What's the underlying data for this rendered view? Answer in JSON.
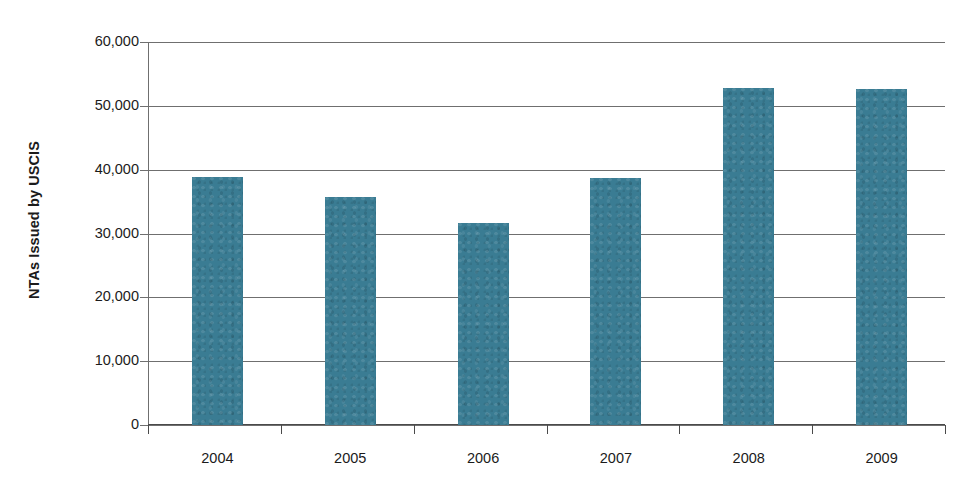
{
  "chart_data": {
    "type": "bar",
    "title": "",
    "subtitle": "",
    "xlabel": "",
    "ylabel": "NTAs Issued by USCIS",
    "categories": [
      "2004",
      "2005",
      "2006",
      "2007",
      "2008",
      "2009"
    ],
    "values": [
      38800,
      35700,
      31600,
      38700,
      52800,
      52600
    ],
    "series": [
      {
        "name": "NTAs Issued by USCIS",
        "values": [
          38800,
          35700,
          31600,
          38700,
          52800,
          52600
        ]
      }
    ],
    "ylim": [
      0,
      60000
    ],
    "ytick_values": [
      0,
      10000,
      20000,
      30000,
      40000,
      50000,
      60000
    ],
    "ytick_labels": [
      "0",
      "10,000",
      "20,000",
      "30,000",
      "40,000",
      "50,000",
      "60,000"
    ],
    "grid": "horizontal",
    "legend": "none",
    "bar_color": "#3a7c93",
    "axis_color": "#6f6f6f",
    "background": "#ffffff"
  }
}
